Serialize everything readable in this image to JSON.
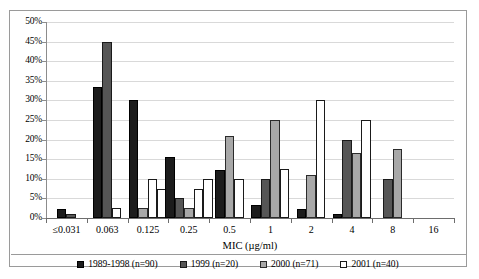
{
  "chart_data": {
    "type": "bar",
    "title": "",
    "xlabel": "MIC (µg/ml)",
    "ylabel": "",
    "ylim": [
      0,
      50
    ],
    "ytick_step": 5,
    "grid": true,
    "legend_position": "bottom",
    "categories": [
      "≤0.031",
      "0.063",
      "0.125",
      "0.25",
      "0.5",
      "1",
      "2",
      "4",
      "8",
      "16"
    ],
    "ytick_labels": [
      "0%",
      "5%",
      "10%",
      "15%",
      "20%",
      "25%",
      "30%",
      "35%",
      "40%",
      "45%",
      "50%"
    ],
    "series": [
      {
        "name": "1989-1998 (n=90)",
        "color": "#1c1c1c",
        "values": [
          2.2,
          33.3,
          30.0,
          15.6,
          12.2,
          3.3,
          2.2,
          1.1,
          0,
          0
        ]
      },
      {
        "name": "1999 (n=20)",
        "color": "#565656",
        "values": [
          1.0,
          45.0,
          0,
          5.0,
          0,
          10.0,
          0,
          20.0,
          10.0,
          0
        ]
      },
      {
        "name": "2000 (n=71)",
        "color": "#a8a8a8",
        "values": [
          0,
          0,
          2.5,
          2.5,
          21.0,
          25.0,
          11.0,
          16.5,
          17.5,
          0
        ]
      },
      {
        "name": "2001 (n=40)",
        "color": "#ffffff",
        "values": [
          0,
          2.5,
          10.0,
          7.5,
          10.0,
          12.5,
          30.0,
          25.0,
          0,
          0
        ]
      }
    ],
    "series_2001_extra_bar": [
      0,
      0,
      7.5,
      10.0,
      0,
      0,
      0,
      0,
      0,
      0
    ]
  },
  "legend": {
    "items": [
      {
        "label": "1989-1998 (n=90)",
        "swatch": "black-square-icon"
      },
      {
        "label": "1999 (n=20)",
        "swatch": "dark-gray-square-icon"
      },
      {
        "label": "2000 (n=71)",
        "swatch": "light-gray-square-icon"
      },
      {
        "label": "2001 (n=40)",
        "swatch": "white-square-icon"
      }
    ]
  }
}
